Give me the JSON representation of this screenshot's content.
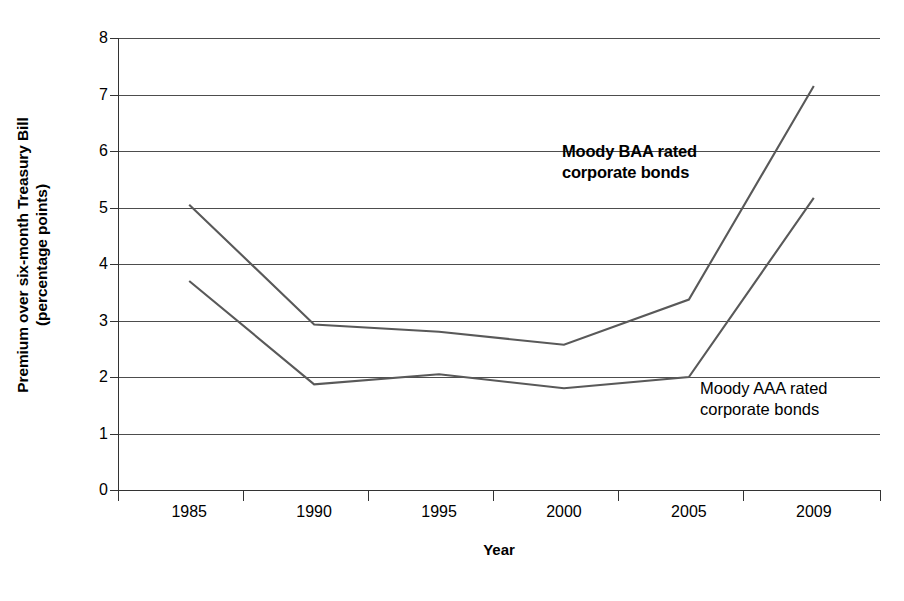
{
  "chart_data": {
    "type": "line",
    "title": "",
    "xlabel": "Year",
    "ylabel": "Premium over six-month Treasury Bill (percentage points)",
    "ylabel_line1": "Premium over six-month Treasury Bill",
    "ylabel_line2": "(percentage points)",
    "categories": [
      "1985",
      "1990",
      "1995",
      "2000",
      "2005",
      "2009"
    ],
    "x": [
      1985,
      1990,
      1995,
      2000,
      2005,
      2009
    ],
    "ylim": [
      0,
      8
    ],
    "yticks": [
      "8",
      "7",
      "6",
      "5",
      "4",
      "3",
      "2",
      "1",
      "0"
    ],
    "ytick_values": [
      8,
      7,
      6,
      5,
      4,
      3,
      2,
      1,
      0
    ],
    "xtick_labels": [
      "1985",
      "1990",
      "1995",
      "2000",
      "2005",
      "2009"
    ],
    "grid": true,
    "legend_position": "inline-annotations",
    "series": [
      {
        "name": "Moody BAA rated corporate bonds",
        "label_line1": "Moody BAA rated",
        "label_line2": "corporate bonds",
        "color": "#595959",
        "bold_label": true,
        "values": [
          5.05,
          2.93,
          2.8,
          2.57,
          3.37,
          7.15
        ]
      },
      {
        "name": "Moody AAA rated corporate bonds",
        "label_line1": "Moody AAA rated",
        "label_line2": "corporate bonds",
        "color": "#595959",
        "bold_label": false,
        "values": [
          3.7,
          1.87,
          2.05,
          1.8,
          2.0,
          5.17
        ]
      }
    ]
  },
  "colors": {
    "background": "#ffffff",
    "line": "#595959",
    "grid": "#4d4d4d",
    "axis": "#333333",
    "text": "#000000"
  }
}
